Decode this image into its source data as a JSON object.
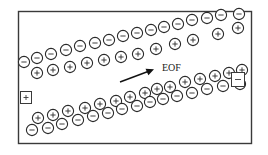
{
  "diagram": {
    "flow_label": "EOF",
    "anode": {
      "symbol": "+",
      "side": "left",
      "label": "anode-electrode"
    },
    "cathode": {
      "symbol": "-",
      "side": "right",
      "label": "cathode-electrode"
    },
    "colors": {
      "line": "#2a2a2a",
      "background": "#ffffff"
    },
    "bands": [
      {
        "name": "upper-wall-double-layer",
        "rows": [
          {
            "charge": "-",
            "role": "wall-fixed-charges",
            "count": 16
          },
          {
            "charge": "+",
            "role": "mobile-counter-ions",
            "count": 12
          }
        ]
      },
      {
        "name": "lower-wall-double-layer",
        "rows": [
          {
            "charge": "+",
            "role": "mobile-counter-ions",
            "count": 15
          },
          {
            "charge": "-",
            "role": "wall-fixed-charges",
            "count": 15
          }
        ]
      }
    ]
  }
}
